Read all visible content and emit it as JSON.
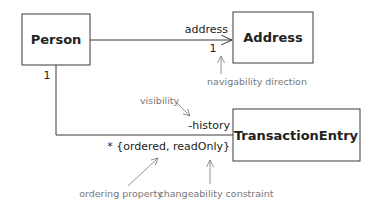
{
  "diagram": {
    "type": "UML class diagram",
    "classes": [
      {
        "id": "person",
        "name": "Person"
      },
      {
        "id": "address",
        "name": "Address"
      },
      {
        "id": "transaction",
        "name": "TransactionEntry"
      }
    ],
    "associations": {
      "person_address": {
        "role": "address",
        "target_multiplicity": "1",
        "navigable_to": "Address"
      },
      "person_transaction": {
        "source_multiplicity": "1",
        "role": "-history",
        "target_multiplicity": "*",
        "constraints": "{ordered, readOnly}",
        "target_label": "* {ordered, readOnly}"
      }
    },
    "annotations": {
      "navigability": "navigability direction",
      "visibility": "visibility",
      "ordering": "ordering property",
      "changeability": "changeability constraint"
    },
    "colors": {
      "line": "#3a3a3a",
      "annotation": "#777777",
      "text": "#222222"
    }
  }
}
